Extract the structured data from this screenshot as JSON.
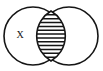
{
  "figure": {
    "name": "venn-diagram",
    "background_color": "#ffffff",
    "stroke_color": "#151515",
    "width": 103,
    "height": 71
  },
  "diagram": {
    "type": "venn",
    "set_count": 2,
    "sets": [
      {
        "id": "left-set",
        "label": "",
        "center_x": 33,
        "center_y": 36,
        "radius": 29
      },
      {
        "id": "right-set",
        "label": "",
        "center_x": 69,
        "center_y": 36,
        "radius": 29
      }
    ],
    "labels": [
      {
        "id": "left-region-label",
        "text": "X",
        "x": 20,
        "y": 35,
        "region": "left-only"
      }
    ],
    "shaded_region": {
      "id": "intersection-lens",
      "region": "intersection",
      "fill_pattern": "horizontal-hatch",
      "hatch_line_count": 12,
      "hatch_spacing": 4.2,
      "hatch_color": "#151515",
      "top_point_x": 51,
      "top_point_y": 11,
      "bottom_point_x": 51,
      "bottom_point_y": 61,
      "left_extent_x": 37,
      "right_extent_x": 65
    }
  }
}
